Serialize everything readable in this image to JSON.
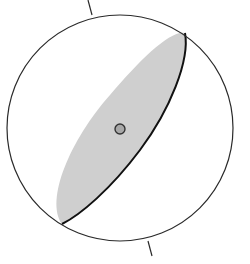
{
  "diagram": {
    "type": "stereonet",
    "background": "#ffffff",
    "primitive_circle": {
      "cx": 120,
      "cy": 128,
      "r": 113,
      "stroke": "#2a2a2a"
    },
    "ticks": [
      {
        "name": "north-tick",
        "x1": 88,
        "y1": 0,
        "x2": 92,
        "y2": 15
      },
      {
        "name": "south-tick",
        "x1": 148,
        "y1": 241,
        "x2": 152,
        "y2": 256
      }
    ],
    "shaded_region": {
      "fill": "#cfcfcf",
      "stroke": "#111111"
    },
    "pole_point": {
      "cx": 120,
      "cy": 129,
      "r": 5,
      "fill": "#a8a8a8",
      "stroke": "#333333"
    }
  }
}
